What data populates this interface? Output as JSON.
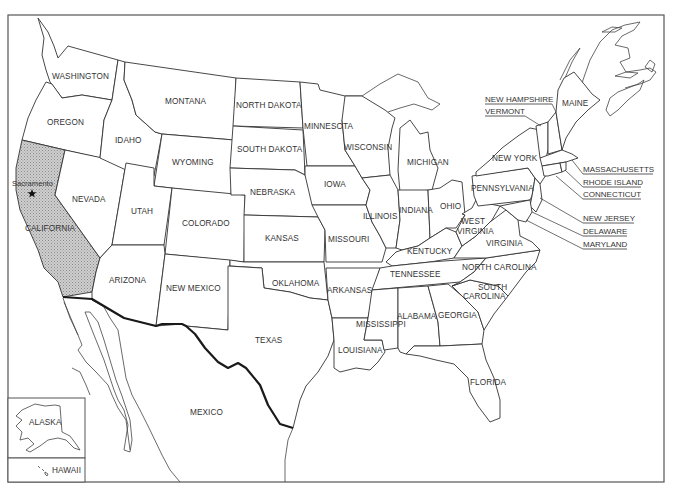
{
  "map": {
    "title": "United States outline map",
    "highlighted_state": "CALIFORNIA",
    "highlight_color": "#bdbdbd",
    "capital": {
      "name": "Sacramento",
      "icon": "star-icon"
    },
    "states": {
      "washington": "WASHINGTON",
      "oregon": "OREGON",
      "california": "CALIFORNIA",
      "idaho": "IDAHO",
      "nevada": "NEVADA",
      "montana": "MONTANA",
      "wyoming": "WYOMING",
      "utah": "UTAH",
      "arizona": "ARIZONA",
      "colorado": "COLORADO",
      "new_mexico": "NEW MEXICO",
      "north_dakota": "NORTH DAKOTA",
      "south_dakota": "SOUTH DAKOTA",
      "nebraska": "NEBRASKA",
      "kansas": "KANSAS",
      "oklahoma": "OKLAHOMA",
      "texas": "TEXAS",
      "minnesota": "MINNESOTA",
      "iowa": "IOWA",
      "missouri": "MISSOURI",
      "arkansas": "ARKANSAS",
      "louisiana": "LOUISIANA",
      "wisconsin": "WISCONSIN",
      "illinois": "ILLINOIS",
      "michigan": "MICHIGAN",
      "indiana": "INDIANA",
      "ohio": "OHIO",
      "kentucky": "KENTUCKY",
      "tennessee": "TENNESSEE",
      "mississippi": "MISSISSIPPI",
      "alabama": "ALABAMA",
      "georgia": "GEORGIA",
      "florida": "FLORIDA",
      "south_carolina_1": "SOUTH",
      "south_carolina_2": "CAROLINA",
      "north_carolina": "NORTH CAROLINA",
      "virginia": "VIRGINIA",
      "west_virginia_1": "WEST",
      "west_virginia_2": "VIRGINIA",
      "pennsylvania": "PENNSYLVANIA",
      "new_york": "NEW YORK",
      "maine": "MAINE"
    },
    "callouts": {
      "new_hampshire": "NEW HAMPSHIRE",
      "vermont": "VERMONT",
      "massachusetts": "MASSACHUSETTS",
      "rhode_island": "RHODE ISLAND",
      "connecticut": "CONNECTICUT",
      "new_jersey": "NEW JERSEY",
      "delaware": "DELAWARE",
      "maryland": "MARYLAND"
    },
    "other": {
      "mexico": "MEXICO",
      "alaska": "ALASKA",
      "hawaii": "HAWAII"
    }
  }
}
